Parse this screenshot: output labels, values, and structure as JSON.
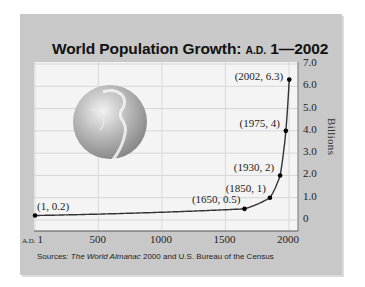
{
  "chart_data": {
    "type": "line",
    "title": "World Population Growth: A.D. 1—2002",
    "title_parts": {
      "main": "World Population Growth: ",
      "era": "A.D.",
      "range": " 1—2002"
    },
    "xlabel": "",
    "ylabel": "Billions",
    "x_ticks": [
      "A.D. 1",
      "500",
      "1000",
      "1500",
      "2000"
    ],
    "x_tick_values": [
      1,
      500,
      1000,
      1500,
      2000
    ],
    "y_ticks": [
      "0",
      "1.0",
      "2.0",
      "3.0",
      "4.0",
      "5.0",
      "6.0",
      "7.0"
    ],
    "xlim": [
      1,
      2002
    ],
    "ylim": [
      0,
      7
    ],
    "grid": true,
    "series": [
      {
        "name": "World Population",
        "points": [
          {
            "x": 1,
            "y": 0.2,
            "label": "(1, 0.2)"
          },
          {
            "x": 1650,
            "y": 0.5,
            "label": "(1650, 0.5)"
          },
          {
            "x": 1850,
            "y": 1,
            "label": "(1850, 1)"
          },
          {
            "x": 1930,
            "y": 2,
            "label": "(1930, 2)"
          },
          {
            "x": 1975,
            "y": 4,
            "label": "(1975, 4)"
          },
          {
            "x": 2002,
            "y": 6.3,
            "label": "(2002, 6.3)"
          }
        ]
      }
    ],
    "decoration": "globe-image",
    "source": {
      "prefix": "Sources: ",
      "italic": "The World Almanac",
      "rest": " 2000 and U.S. Bureau of the Census"
    }
  },
  "labels": {
    "x_ad": "A.D.",
    "x_first": "1"
  }
}
